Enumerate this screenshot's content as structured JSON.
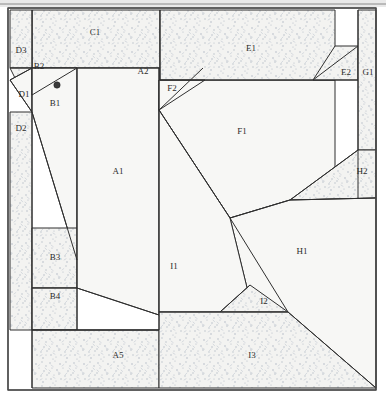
{
  "diagram": {
    "type": "quilt-foundation-paper-piecing-pattern",
    "canvas": {
      "width": 386,
      "height": 404
    },
    "frame": {
      "x": 8,
      "y": 8,
      "width": 368,
      "height": 382,
      "stroke": "#4a4a4a"
    },
    "colors": {
      "plain_fill": "#f7f7f5",
      "stipple_fill": "#f2f2f0",
      "stipple_ink": "#b9bfc9",
      "line": "#2f2f2f",
      "label": "#2b2b2b",
      "frame": "#4a4a4a",
      "top_band": "#e9e9e9"
    },
    "marker": {
      "name": "start-dot",
      "x": 57,
      "y": 85,
      "r": 3.2
    },
    "pieces": [
      {
        "id": "C1",
        "label": "C1",
        "fill": "stipple",
        "label_x": 95,
        "label_y": 33,
        "points": "32,10 160,10 160,68 32,68"
      },
      {
        "id": "D3",
        "label": "D3",
        "fill": "stipple",
        "label_x": 21,
        "label_y": 51,
        "points": "10,10 32,10 32,68 10,68"
      },
      {
        "id": "D2",
        "label": "D2",
        "fill": "stipple",
        "label_x": 21,
        "label_y": 129,
        "points": "10,68 32,68 32,112 10,112 10,330 32,330 32,112"
      },
      {
        "id": "D1",
        "label": "D1",
        "fill": "plain",
        "label_x": 24,
        "label_y": 95,
        "points": "10,80 32,68 32,112"
      },
      {
        "id": "B2",
        "label": "B2",
        "fill": "plain",
        "label_x": 39,
        "label_y": 67,
        "points": "32,68 77,68 32,95"
      },
      {
        "id": "B1",
        "label": "B1",
        "fill": "plain",
        "label_x": 55,
        "label_y": 104,
        "points": "32,68 77,68 77,260 32,112"
      },
      {
        "id": "B3",
        "label": "B3",
        "fill": "stipple",
        "label_x": 55,
        "label_y": 258,
        "points": "32,228 77,228 77,288 32,288"
      },
      {
        "id": "B4",
        "label": "B4",
        "fill": "stipple",
        "label_x": 55,
        "label_y": 297,
        "points": "32,288 77,288 77,330 32,330"
      },
      {
        "id": "A1",
        "label": "A1",
        "fill": "plain",
        "label_x": 118,
        "label_y": 172,
        "points": "77,68 159,68 159,315 77,288"
      },
      {
        "id": "A2",
        "label": "A2",
        "fill": "stipple",
        "label_x": 143,
        "label_y": 72,
        "points": "160,68 203,68 159,110"
      },
      {
        "id": "A5",
        "label": "A5",
        "fill": "stipple",
        "label_x": 118,
        "label_y": 356,
        "points": "32,330 159,330 159,388 32,388"
      },
      {
        "id": "F2",
        "label": "F2",
        "fill": "stipple",
        "label_x": 172,
        "label_y": 89,
        "points": "159,80 205,80 159,110"
      },
      {
        "id": "F1",
        "label": "F1",
        "fill": "plain",
        "label_x": 242,
        "label_y": 132,
        "points": "159,80 335,80 335,180 290,200 230,218 159,110"
      },
      {
        "id": "E1",
        "label": "E1",
        "fill": "stipple",
        "label_x": 251,
        "label_y": 49,
        "points": "160,10 335,10 335,80 160,80"
      },
      {
        "id": "E2",
        "label": "E2",
        "fill": "stipple",
        "label_x": 346,
        "label_y": 73,
        "points": "335,46 358,46 358,80 313,80"
      },
      {
        "id": "G1",
        "label": "G1",
        "fill": "stipple",
        "label_x": 368,
        "label_y": 73,
        "points": "358,10 376,10 376,150 358,150"
      },
      {
        "id": "H2",
        "label": "H2",
        "fill": "stipple",
        "label_x": 362,
        "label_y": 172,
        "points": "358,150 376,150 376,198 290,200"
      },
      {
        "id": "H1",
        "label": "H1",
        "fill": "plain",
        "label_x": 302,
        "label_y": 252,
        "points": "230,218 290,200 376,198 376,388 250,300"
      },
      {
        "id": "I1",
        "label": "I1",
        "fill": "plain",
        "label_x": 174,
        "label_y": 267,
        "points": "159,110 230,218 250,300 220,312 159,312"
      },
      {
        "id": "I2",
        "label": "I2",
        "fill": "stipple",
        "label_x": 264,
        "label_y": 302,
        "points": "220,312 250,285 288,312"
      },
      {
        "id": "I3",
        "label": "I3",
        "fill": "stipple",
        "label_x": 252,
        "label_y": 356,
        "points": "159,312 288,312 376,388 159,388"
      }
    ],
    "edges": [
      {
        "name": "frame-outer",
        "points": "8,8 376,8 376,390 8,390 8,8"
      },
      {
        "name": "left-strip",
        "points": "32,10 32,388"
      },
      {
        "name": "b-column",
        "points": "77,68 77,330"
      },
      {
        "name": "a1-right",
        "points": "159,68 159,330"
      },
      {
        "name": "c1-bottom",
        "points": "32,68 160,68"
      },
      {
        "name": "e1-bottom",
        "points": "160,80 358,80"
      },
      {
        "name": "e1-left",
        "points": "160,10 160,80"
      },
      {
        "name": "g1-left",
        "points": "358,10 358,198"
      },
      {
        "name": "d3-bottom",
        "points": "10,68 32,68"
      },
      {
        "name": "d1-upper",
        "points": "32,68 10,80"
      },
      {
        "name": "d1-lower",
        "points": "10,80 32,112"
      },
      {
        "name": "b2-diagonal",
        "points": "77,68 32,95"
      },
      {
        "name": "b1-lower-diag",
        "points": "32,112 77,260"
      },
      {
        "name": "b3-bottom",
        "points": "32,288 77,288"
      },
      {
        "name": "b4-bottom",
        "points": "32,330 159,330"
      },
      {
        "name": "a1-bottom-diag",
        "points": "77,288 159,315"
      },
      {
        "name": "a2-diagonal",
        "points": "203,68 159,110"
      },
      {
        "name": "f2-top",
        "points": "159,80 205,80"
      },
      {
        "name": "f2-diagonal",
        "points": "205,80 159,110"
      },
      {
        "name": "f1-i1-diagonal",
        "points": "159,110 230,218"
      },
      {
        "name": "f1-h2-diagonal",
        "points": "230,218 290,200"
      },
      {
        "name": "h2-upper",
        "points": "290,200 358,150"
      },
      {
        "name": "h2-lower",
        "points": "290,200 376,198"
      },
      {
        "name": "e2-diagonal",
        "points": "313,80 358,46"
      },
      {
        "name": "i1-h1-diagonal",
        "points": "230,218 288,312"
      },
      {
        "name": "i2-left",
        "points": "220,312 250,285"
      },
      {
        "name": "i3-top",
        "points": "159,312 288,312"
      },
      {
        "name": "i3-diagonal",
        "points": "288,312 376,388"
      },
      {
        "name": "a5-top",
        "points": "32,330 159,330"
      }
    ]
  }
}
